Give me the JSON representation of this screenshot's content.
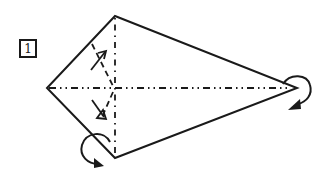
{
  "diagram": {
    "step_number": "1",
    "colors": {
      "line": "#1a1a1a",
      "background": "#ffffff"
    },
    "shape": {
      "type": "kite",
      "vertices": {
        "top": [
          115,
          16
        ],
        "left": [
          47,
          88
        ],
        "bottom": [
          115,
          158
        ],
        "right": [
          297,
          88
        ]
      }
    },
    "fold_lines": [
      {
        "name": "horizontal-mountain-fold",
        "style": "dash-dot",
        "from": [
          47,
          88
        ],
        "to": [
          297,
          88
        ]
      },
      {
        "name": "vertical-mountain-fold",
        "style": "dash-dot",
        "from": [
          115,
          16
        ],
        "to": [
          115,
          158
        ]
      },
      {
        "name": "upper-valley-fold",
        "style": "dashed",
        "from": [
          92,
          45
        ],
        "to": [
          113,
          86
        ]
      },
      {
        "name": "lower-valley-fold",
        "style": "dashed",
        "from": [
          113,
          90
        ],
        "to": [
          100,
          118
        ]
      }
    ],
    "arrows": [
      {
        "name": "upper-fold-arrow",
        "type": "valley-fold-arrow",
        "direction": "up-right"
      },
      {
        "name": "lower-fold-arrow",
        "type": "valley-fold-arrow",
        "direction": "down-right"
      },
      {
        "name": "bottom-turn-arrow",
        "type": "fold-behind-arrow",
        "position": "bottom-left"
      },
      {
        "name": "right-turn-arrow",
        "type": "fold-behind-arrow",
        "position": "right"
      }
    ]
  }
}
